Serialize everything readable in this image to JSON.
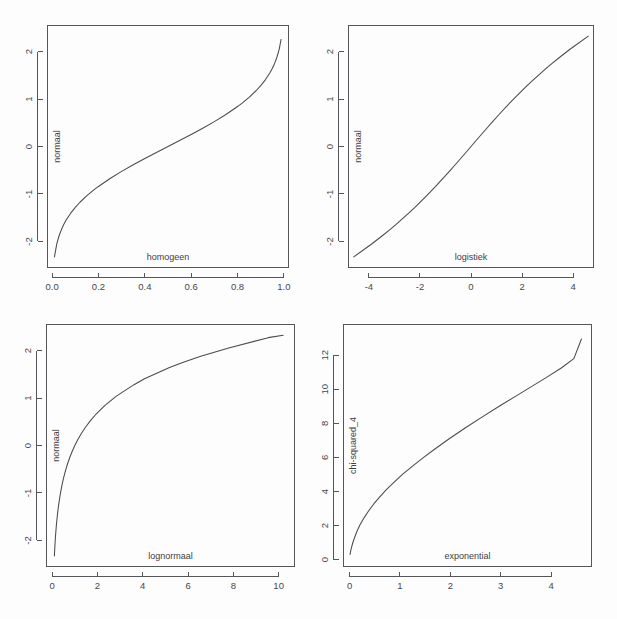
{
  "figure": {
    "title": "",
    "layout": "2x2 grid of quantile-quantile plots",
    "background": "#fdfdfd",
    "line_color": "#4a4b4e",
    "axis_color": "#55565a"
  },
  "chart_data": [
    {
      "type": "line",
      "panel": "top-left",
      "title": "",
      "xlabel": "homogeen",
      "ylabel": "normaal",
      "xlim": [
        -0.02,
        1.02
      ],
      "ylim": [
        -2.55,
        2.55
      ],
      "xticks": [
        0.0,
        0.2,
        0.4,
        0.6,
        0.8,
        1.0
      ],
      "xticklabels": [
        "0.0",
        "0.2",
        "0.4",
        "0.6",
        "0.8",
        "1.0"
      ],
      "yticks": [
        -2,
        -1,
        0,
        1,
        2
      ],
      "yticklabels": [
        "-2",
        "-1",
        "0",
        "1",
        "2"
      ],
      "grid": false,
      "legend": "none",
      "x": [
        0.01,
        0.02,
        0.03,
        0.04,
        0.05,
        0.06,
        0.08,
        0.1,
        0.12,
        0.15,
        0.18,
        0.2,
        0.25,
        0.3,
        0.35,
        0.4,
        0.45,
        0.5,
        0.55,
        0.6,
        0.65,
        0.7,
        0.75,
        0.8,
        0.82,
        0.85,
        0.88,
        0.9,
        0.92,
        0.94,
        0.95,
        0.96,
        0.97,
        0.98,
        0.988
      ],
      "y": [
        -2.326,
        -2.054,
        -1.881,
        -1.751,
        -1.645,
        -1.555,
        -1.405,
        -1.282,
        -1.175,
        -1.036,
        -0.915,
        -0.842,
        -0.674,
        -0.524,
        -0.385,
        -0.253,
        -0.126,
        0.0,
        0.126,
        0.253,
        0.385,
        0.524,
        0.674,
        0.842,
        0.915,
        1.036,
        1.175,
        1.282,
        1.405,
        1.555,
        1.645,
        1.751,
        1.881,
        2.054,
        2.257
      ]
    },
    {
      "type": "line",
      "panel": "top-right",
      "title": "",
      "xlabel": "logistiek",
      "ylabel": "normaal",
      "xlim": [
        -4.8,
        4.8
      ],
      "ylim": [
        -2.55,
        2.55
      ],
      "xticks": [
        -4,
        -2,
        0,
        2,
        4
      ],
      "xticklabels": [
        "-4",
        "-2",
        "0",
        "2",
        "4"
      ],
      "yticks": [
        -2,
        -1,
        0,
        1,
        2
      ],
      "yticklabels": [
        "-2",
        "-1",
        "0",
        "1",
        "2"
      ],
      "grid": false,
      "legend": "none",
      "x": [
        -4.595,
        -3.892,
        -3.476,
        -3.178,
        -2.944,
        -2.442,
        -2.197,
        -1.734,
        -1.386,
        -1.099,
        -0.847,
        -0.619,
        -0.405,
        -0.201,
        0.0,
        0.201,
        0.405,
        0.619,
        0.847,
        1.099,
        1.386,
        1.734,
        2.197,
        2.442,
        2.944,
        3.178,
        3.476,
        3.892,
        4.595
      ],
      "y": [
        -2.326,
        -2.054,
        -1.881,
        -1.751,
        -1.645,
        -1.405,
        -1.282,
        -1.036,
        -0.842,
        -0.674,
        -0.524,
        -0.385,
        -0.253,
        -0.126,
        0.0,
        0.126,
        0.253,
        0.385,
        0.524,
        0.674,
        0.842,
        1.036,
        1.282,
        1.405,
        1.645,
        1.751,
        1.881,
        2.054,
        2.326
      ]
    },
    {
      "type": "line",
      "panel": "bottom-left",
      "title": "",
      "xlabel": "lognormaal",
      "ylabel": "normaal",
      "xlim": [
        -0.25,
        10.7
      ],
      "ylim": [
        -2.55,
        2.55
      ],
      "xticks": [
        0,
        2,
        4,
        6,
        8,
        10
      ],
      "xticklabels": [
        "0",
        "2",
        "4",
        "6",
        "8",
        "10"
      ],
      "yticks": [
        -2,
        -1,
        0,
        1,
        2
      ],
      "yticklabels": [
        "-2",
        "-1",
        "0",
        "1",
        "2"
      ],
      "grid": false,
      "legend": "none",
      "x": [
        0.098,
        0.128,
        0.152,
        0.174,
        0.193,
        0.245,
        0.277,
        0.355,
        0.431,
        0.51,
        0.592,
        0.68,
        0.776,
        0.882,
        1.0,
        1.134,
        1.288,
        1.47,
        1.69,
        1.961,
        2.321,
        2.819,
        3.614,
        4.077,
        5.181,
        5.763,
        6.559,
        7.796,
        9.538,
        10.2
      ],
      "y": [
        -2.326,
        -2.054,
        -1.881,
        -1.751,
        -1.645,
        -1.405,
        -1.282,
        -1.036,
        -0.842,
        -0.674,
        -0.524,
        -0.385,
        -0.253,
        -0.126,
        0.0,
        0.126,
        0.253,
        0.385,
        0.524,
        0.674,
        0.842,
        1.036,
        1.282,
        1.405,
        1.645,
        1.751,
        1.881,
        2.054,
        2.273,
        2.322
      ]
    },
    {
      "type": "line",
      "panel": "bottom-right",
      "title": "",
      "xlabel": "exponential",
      "ylabel": "chi-squared_4",
      "xlim": [
        -0.12,
        4.8
      ],
      "ylim": [
        -0.4,
        13.8
      ],
      "xticks": [
        0,
        1,
        2,
        3,
        4
      ],
      "xticklabels": [
        "0",
        "1",
        "2",
        "3",
        "4"
      ],
      "yticks": [
        0,
        2,
        4,
        6,
        8,
        10,
        12
      ],
      "yticklabels": [
        "0",
        "2",
        "4",
        "6",
        "8",
        "10",
        "12"
      ],
      "grid": false,
      "legend": "none",
      "x": [
        0.01,
        0.03,
        0.06,
        0.1,
        0.15,
        0.21,
        0.29,
        0.38,
        0.48,
        0.6,
        0.73,
        0.88,
        1.05,
        1.25,
        1.47,
        1.7,
        1.97,
        2.3,
        2.65,
        3.0,
        3.3,
        3.6,
        3.9,
        4.2,
        4.45,
        4.6
      ],
      "y": [
        0.305,
        0.62,
        0.95,
        1.3,
        1.68,
        2.06,
        2.47,
        2.87,
        3.27,
        3.69,
        4.11,
        4.54,
        5.0,
        5.49,
        6.0,
        6.51,
        7.08,
        7.74,
        8.41,
        9.06,
        9.6,
        10.14,
        10.68,
        11.25,
        11.8,
        12.95
      ]
    }
  ]
}
